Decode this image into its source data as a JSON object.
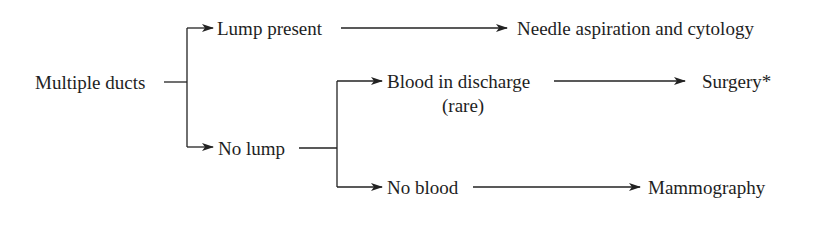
{
  "diagram": {
    "type": "flowchart",
    "nodes": {
      "root": {
        "label": "Multiple ducts"
      },
      "lump_present": {
        "label": "Lump present"
      },
      "no_lump": {
        "label": "No lump"
      },
      "needle": {
        "label": "Needle aspiration and cytology"
      },
      "blood": {
        "label": "Blood in discharge",
        "sublabel": "(rare)"
      },
      "no_blood": {
        "label": "No blood"
      },
      "surgery": {
        "label": "Surgery*"
      },
      "mammography": {
        "label": "Mammography"
      }
    },
    "edges": [
      {
        "from": "Multiple ducts",
        "to": "Lump present"
      },
      {
        "from": "Multiple ducts",
        "to": "No lump"
      },
      {
        "from": "Lump present",
        "to": "Needle aspiration and cytology"
      },
      {
        "from": "No lump",
        "to": "Blood in discharge"
      },
      {
        "from": "No lump",
        "to": "No blood"
      },
      {
        "from": "Blood in discharge",
        "to": "Surgery*"
      },
      {
        "from": "No blood",
        "to": "Mammography"
      }
    ],
    "colors": {
      "line": "#222222",
      "text": "#1e1e1e",
      "background": "#ffffff"
    }
  }
}
